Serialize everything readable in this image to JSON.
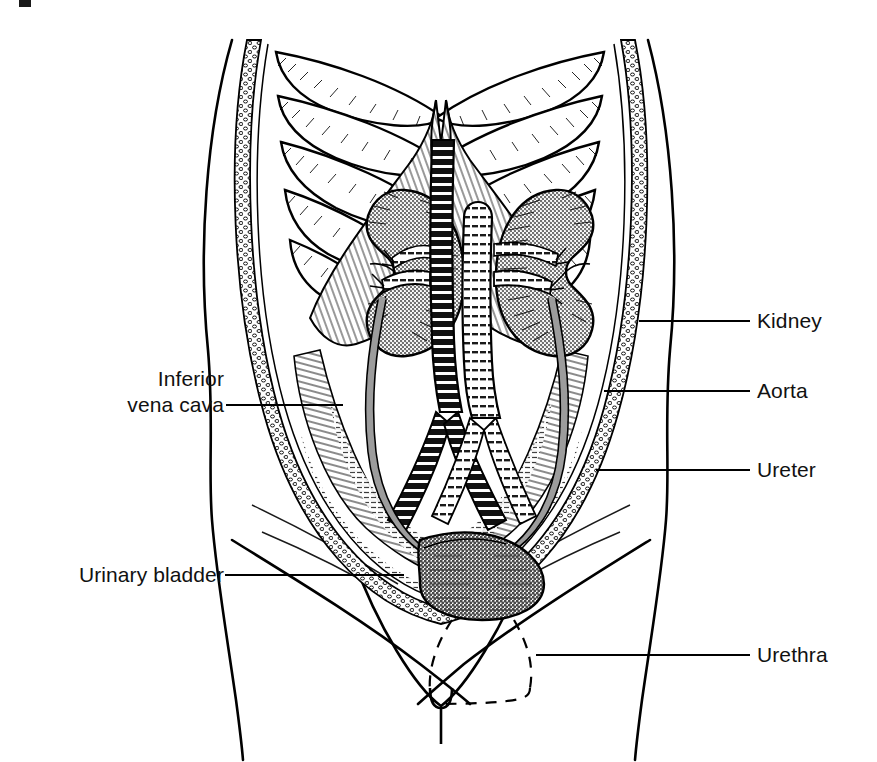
{
  "figure": {
    "width": 877,
    "height": 762,
    "background": "#ffffff",
    "ink": "#000000",
    "organ_fill_gray": "#a9a9a9",
    "vessel_gray": "#9c9c9c"
  },
  "labels": [
    {
      "id": "kidney",
      "text": "Kidney",
      "side": "right",
      "x": 757,
      "y": 308,
      "leader": {
        "x1": 639,
        "y1": 321,
        "x2": 750,
        "y2": 321
      }
    },
    {
      "id": "aorta",
      "text": "Aorta",
      "side": "right",
      "x": 757,
      "y": 378,
      "leader": {
        "x1": 604,
        "y1": 391,
        "x2": 750,
        "y2": 391
      }
    },
    {
      "id": "ureter",
      "text": "Ureter",
      "side": "right",
      "x": 757,
      "y": 457,
      "leader": {
        "x1": 596,
        "y1": 470,
        "x2": 750,
        "y2": 470
      }
    },
    {
      "id": "urethra",
      "text": "Urethra",
      "side": "right",
      "x": 757,
      "y": 642,
      "leader": {
        "x1": 536,
        "y1": 655,
        "x2": 750,
        "y2": 655
      }
    },
    {
      "id": "inferior-vena-cava",
      "text": "Inferior\nvena cava",
      "side": "left",
      "x": 92,
      "y": 366,
      "leader": {
        "x1": 226,
        "y1": 405,
        "x2": 343,
        "y2": 405
      }
    },
    {
      "id": "urinary-bladder",
      "text": "Urinary bladder",
      "side": "left",
      "x": 42,
      "y": 562,
      "leader": {
        "x1": 225,
        "y1": 575,
        "x2": 404,
        "y2": 575
      }
    }
  ],
  "structures": [
    {
      "id": "rib-cage",
      "name": "Rib cage",
      "pairs": 5
    },
    {
      "id": "diaphragm",
      "name": "Diaphragm"
    },
    {
      "id": "kidney-left",
      "name": "Left kidney",
      "fill": "gray-halftone"
    },
    {
      "id": "kidney-right",
      "name": "Right kidney",
      "fill": "gray-halftone"
    },
    {
      "id": "aorta-vessel",
      "name": "Abdominal aorta",
      "fill": "dark"
    },
    {
      "id": "vena-cava-vessel",
      "name": "Inferior vena cava",
      "fill": "light"
    },
    {
      "id": "renal-arteries",
      "name": "Renal arteries"
    },
    {
      "id": "renal-veins",
      "name": "Renal veins"
    },
    {
      "id": "iliac-vessels",
      "name": "Common iliac vessels"
    },
    {
      "id": "ureter-left",
      "name": "Left ureter",
      "fill": "gray-tube"
    },
    {
      "id": "ureter-right",
      "name": "Right ureter",
      "fill": "gray-tube"
    },
    {
      "id": "bladder",
      "name": "Urinary bladder",
      "fill": "gray-halftone"
    },
    {
      "id": "urethra-tube",
      "name": "Urethra",
      "style": "dashed"
    },
    {
      "id": "body-outline",
      "name": "Torso outline"
    },
    {
      "id": "abdominal-wall",
      "name": "Abdominal wall / fat layer",
      "style": "stippled"
    },
    {
      "id": "psoas-muscles",
      "name": "Psoas and posterior abdominal muscles",
      "style": "hatched"
    }
  ],
  "artifact": {
    "id": "scan-speck",
    "x": 19,
    "y": 0,
    "w": 12,
    "h": 7
  }
}
